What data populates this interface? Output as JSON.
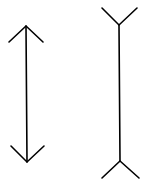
{
  "diagram": {
    "type": "muller-lyer-illusion",
    "stroke_color": "#000000",
    "background": "#ffffff",
    "figures": [
      {
        "name": "arrowheads-inward",
        "shaft": {
          "x1": 26,
          "y1": 26,
          "x2": 27,
          "y2": 162
        },
        "top": [
          {
            "x1": 9,
            "y1": 42,
            "x2": 26,
            "y2": 26
          },
          {
            "x1": 26,
            "y1": 26,
            "x2": 43,
            "y2": 42
          }
        ],
        "bottom": [
          {
            "x1": 11,
            "y1": 146,
            "x2": 27,
            "y2": 162
          },
          {
            "x1": 27,
            "y1": 162,
            "x2": 44,
            "y2": 146
          }
        ]
      },
      {
        "name": "fins-outward",
        "shaft": {
          "x1": 119,
          "y1": 25,
          "x2": 120,
          "y2": 161
        },
        "top": [
          {
            "x1": 102,
            "y1": 8,
            "x2": 119,
            "y2": 25
          },
          {
            "x1": 119,
            "y1": 25,
            "x2": 137,
            "y2": 8
          }
        ],
        "bottom": [
          {
            "x1": 102,
            "y1": 178,
            "x2": 120,
            "y2": 161
          },
          {
            "x1": 120,
            "y1": 161,
            "x2": 139,
            "y2": 178
          }
        ]
      }
    ]
  }
}
